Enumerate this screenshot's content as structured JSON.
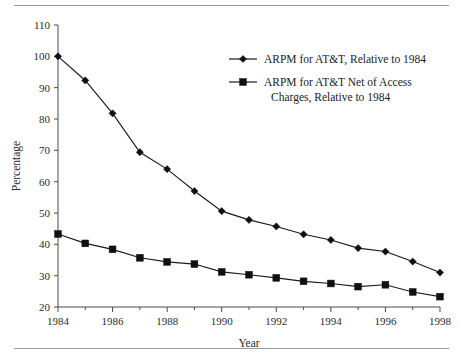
{
  "chart_data": {
    "type": "line",
    "title": "",
    "xlabel": "Year",
    "ylabel": "Percentage",
    "x": [
      1984,
      1985,
      1986,
      1987,
      1988,
      1989,
      1990,
      1991,
      1992,
      1993,
      1994,
      1995,
      1996,
      1997,
      1998
    ],
    "xlim": [
      1984,
      1998
    ],
    "ylim": [
      20,
      110
    ],
    "ytick_labels": [
      "110",
      "100",
      "90",
      "80",
      "70",
      "60",
      "50",
      "40",
      "30",
      "20"
    ],
    "yticks": [
      110,
      100,
      90,
      80,
      70,
      60,
      50,
      40,
      30,
      20
    ],
    "xtick_labels": [
      "1984",
      "1986",
      "1988",
      "1990",
      "1992",
      "1994",
      "1996",
      "1998"
    ],
    "xticks": [
      1984,
      1986,
      1988,
      1990,
      1992,
      1994,
      1996,
      1998
    ],
    "minor_xticks": [
      1985,
      1987,
      1989,
      1991,
      1993,
      1995,
      1997
    ],
    "grid": false,
    "legend_position": "upper-right-inside",
    "series": [
      {
        "name": "ARPM for AT&T, Relative to 1984",
        "marker": "diamond",
        "color": "#101010",
        "values": [
          100.0,
          92.3,
          81.8,
          69.4,
          64.0,
          57.0,
          50.6,
          47.8,
          45.7,
          43.2,
          41.4,
          38.8,
          37.7,
          34.5,
          31.0
        ]
      },
      {
        "name": "ARPM for AT&T Net of Access Charges, Relative to 1984",
        "marker": "square",
        "color": "#101010",
        "values": [
          43.3,
          40.3,
          38.4,
          35.7,
          34.4,
          33.7,
          31.2,
          30.3,
          29.3,
          28.2,
          27.5,
          26.5,
          27.1,
          24.8,
          23.3
        ]
      }
    ]
  },
  "legend": {
    "entries": [
      {
        "line1": "ARPM for AT&T, Relative to 1984",
        "line2": ""
      },
      {
        "line1": "ARPM for AT&T Net of Access",
        "line2": "Charges, Relative to 1984"
      }
    ]
  },
  "axes": {
    "x_title": "Year",
    "y_title": "Percentage"
  },
  "colors": {
    "line": "#101010",
    "axis": "#4a4a4a",
    "rule": "#9a9a9a",
    "text": "#2b2b2b",
    "background": "#ffffff"
  }
}
